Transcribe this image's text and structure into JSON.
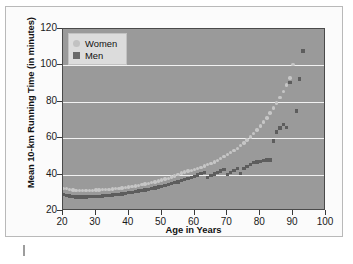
{
  "chart_data": {
    "type": "scatter",
    "title": "",
    "xlabel": "Age in Years",
    "ylabel": "Mean 10-km Running Time (in minutes)",
    "xlim": [
      20,
      100
    ],
    "ylim": [
      20,
      120
    ],
    "xticks": [
      20,
      30,
      40,
      50,
      60,
      70,
      80,
      90,
      100
    ],
    "yticks": [
      20,
      40,
      60,
      80,
      100,
      120
    ],
    "grid": true,
    "legend_position": "top-left",
    "colors": {
      "women": "#c6c6c6",
      "men": "#5d5d5d",
      "plot_background": "#9a9a9a",
      "gridline": "#f2f2f2",
      "legend_background": "#dcdcdc"
    },
    "series": [
      {
        "name": "Women",
        "marker": "circle",
        "x": [
          20,
          21,
          22,
          23,
          24,
          25,
          26,
          27,
          28,
          29,
          30,
          31,
          32,
          33,
          34,
          35,
          36,
          37,
          38,
          39,
          40,
          41,
          42,
          43,
          44,
          45,
          46,
          47,
          48,
          49,
          50,
          51,
          52,
          53,
          54,
          55,
          56,
          57,
          58,
          59,
          60,
          61,
          62,
          63,
          64,
          65,
          66,
          67,
          68,
          69,
          70,
          71,
          72,
          73,
          74,
          75,
          76,
          77,
          78,
          79,
          80,
          81,
          82,
          83,
          84,
          85,
          86,
          87,
          88,
          89,
          90
        ],
        "y": [
          32.5,
          32.2,
          31.8,
          31.5,
          31.3,
          31.2,
          31.2,
          31.3,
          31.3,
          31.4,
          31.5,
          31.6,
          31.7,
          31.8,
          31.9,
          32.1,
          32.3,
          32.5,
          32.7,
          32.9,
          33.2,
          33.5,
          33.8,
          34.1,
          34.4,
          34.8,
          35.2,
          35.6,
          36.0,
          36.5,
          37.0,
          37.5,
          38.0,
          38.6,
          39.2,
          39.9,
          40.8,
          41.4,
          41.9,
          42.3,
          42.8,
          43.4,
          44.0,
          44.7,
          45.4,
          46.2,
          47.0,
          47.9,
          48.8,
          49.8,
          50.9,
          52.0,
          53.2,
          54.5,
          55.9,
          57.4,
          59.0,
          60.7,
          62.5,
          64.5,
          66.6,
          68.8,
          71.2,
          73.8,
          76.5,
          79.4,
          82.5,
          85.8,
          89.3,
          93.0,
          100.5
        ]
      },
      {
        "name": "Men",
        "marker": "square",
        "x": [
          20,
          21,
          22,
          23,
          24,
          25,
          26,
          27,
          28,
          29,
          30,
          31,
          32,
          33,
          34,
          35,
          36,
          37,
          38,
          39,
          40,
          41,
          42,
          43,
          44,
          45,
          46,
          47,
          48,
          49,
          50,
          51,
          52,
          53,
          54,
          55,
          56,
          57,
          58,
          59,
          60,
          61,
          62,
          63,
          64,
          65,
          66,
          67,
          68,
          69,
          70,
          71,
          72,
          73,
          74,
          75,
          76,
          77,
          78,
          79,
          80,
          81,
          82,
          83,
          84,
          85,
          86,
          87,
          88,
          89,
          91,
          92,
          93
        ],
        "y": [
          29.0,
          28.6,
          28.2,
          27.9,
          27.7,
          27.6,
          27.6,
          27.7,
          27.8,
          27.9,
          28.0,
          28.1,
          28.2,
          28.4,
          28.6,
          28.8,
          29.0,
          29.2,
          29.4,
          29.7,
          30.0,
          30.3,
          30.6,
          30.9,
          31.2,
          31.5,
          31.9,
          32.3,
          32.7,
          33.1,
          33.5,
          34.0,
          34.5,
          35.0,
          35.5,
          36.0,
          36.6,
          37.2,
          37.8,
          38.4,
          39.1,
          39.8,
          40.5,
          41.3,
          38.5,
          39.5,
          40.3,
          41.1,
          41.9,
          42.8,
          40.2,
          41.2,
          42.2,
          43.3,
          40.5,
          43.5,
          44.5,
          45.5,
          46.5,
          47.0,
          47.3,
          47.8,
          48.0,
          48.1,
          58.5,
          63.5,
          65.5,
          67.5,
          66.0,
          90.5,
          75.0,
          92.5,
          108.0
        ]
      }
    ]
  },
  "legend": {
    "women_label": "Women",
    "men_label": "Men"
  }
}
